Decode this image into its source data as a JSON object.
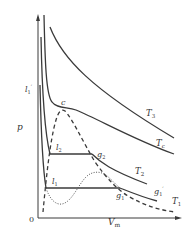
{
  "figure": {
    "type": "p-Vm isotherm diagram",
    "axes": {
      "y_label": "p",
      "x_label": "V",
      "x_label_sub": "m",
      "origin_label": "0"
    },
    "points": {
      "critical": "c",
      "l1_prime": "l",
      "l1_prime_sub": "1",
      "l1_prime_mark": "′",
      "l2": "l",
      "l2_sub": "2",
      "l1": "l",
      "l1_sub": "1",
      "g2": "g",
      "g2_sub": "2",
      "g1": "g",
      "g1_sub": "1",
      "g1_prime": "g",
      "g1_prime_sub": "1",
      "g1_prime_mark": "′"
    },
    "isotherms": [
      {
        "name": "T3",
        "label": "T",
        "sub": "3"
      },
      {
        "name": "Tc",
        "label": "T",
        "sub": "c"
      },
      {
        "name": "T2",
        "label": "T",
        "sub": "2"
      },
      {
        "name": "T1",
        "label": "T",
        "sub": "1"
      }
    ],
    "colors": {
      "line": "#3a3a3a",
      "background": "#ffffff"
    }
  }
}
